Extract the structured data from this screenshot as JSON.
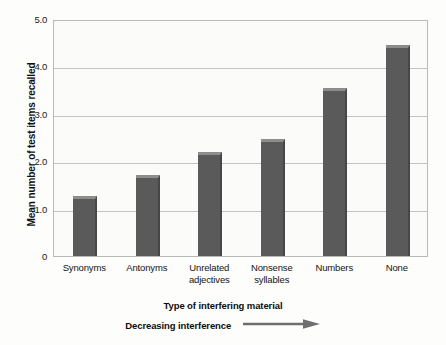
{
  "chart_data": {
    "type": "bar",
    "title": "",
    "xlabel": "Type of interfering material",
    "ylabel": "Mean number of test items recalled",
    "categories": [
      "Synonyms",
      "Antonyms",
      "Unrelated\nadjectives",
      "Nonsense\nsyllables",
      "Numbers",
      "None"
    ],
    "category_lines": [
      [
        "Synonyms"
      ],
      [
        "Antonyms"
      ],
      [
        "Unrelated",
        "adjectives"
      ],
      [
        "Nonsense",
        "syllables"
      ],
      [
        "Numbers"
      ],
      [
        "None"
      ]
    ],
    "values": [
      1.27,
      1.7,
      2.2,
      2.47,
      3.54,
      4.45
    ],
    "ylim": [
      0,
      5.0
    ],
    "yticks": [
      0,
      1.0,
      2.0,
      3.0,
      4.0,
      5.0
    ],
    "ytick_labels": [
      "0",
      "1.0",
      "2.0",
      "3.0",
      "4.0",
      "5.0"
    ],
    "grid": true,
    "legend": "none",
    "bar_color": "#5a5a5a",
    "bar_top_color": "#8d8d8d",
    "bar_edge_color": "#474747",
    "gridline_color": "#c2c2c2",
    "plot_background": "#fbfbfa",
    "frame_color": "#b9b9b9",
    "annotation": {
      "text": "Decreasing interference",
      "arrow": "right-arrow",
      "arrow_color": "#6f6f6f"
    }
  }
}
